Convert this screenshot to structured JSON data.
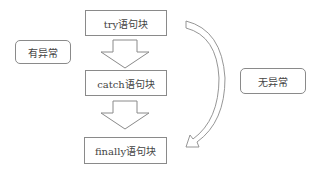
{
  "diagram": {
    "blocks": [
      {
        "id": "try",
        "label": "try语句块"
      },
      {
        "id": "catch",
        "label": "catch语句块"
      },
      {
        "id": "finally",
        "label": "finally语句块"
      }
    ],
    "labels": {
      "has_exception": "有异常",
      "no_exception": "无异常"
    },
    "colors": {
      "stroke": "#8a8a8a",
      "text": "#444444",
      "background": "#ffffff"
    }
  }
}
